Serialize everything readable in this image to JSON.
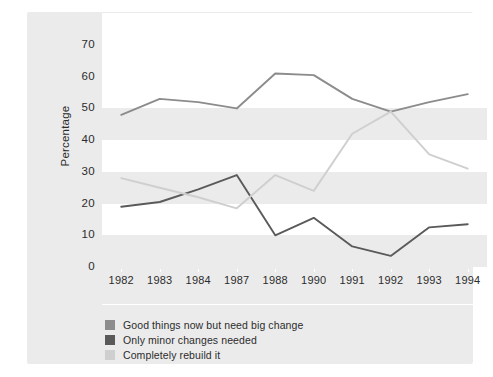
{
  "chart_data": {
    "type": "line",
    "title": "",
    "subtitle": "",
    "xlabel": "",
    "ylabel": "Percentage",
    "categories": [
      "1982",
      "1983",
      "1984",
      "1987",
      "1988",
      "1990",
      "1991",
      "1992",
      "1993",
      "1994"
    ],
    "ylim": [
      0,
      70
    ],
    "ytick_labels": [
      "0",
      "10",
      "20",
      "30",
      "40",
      "50",
      "60",
      "70"
    ],
    "ytick_values": [
      0,
      10,
      20,
      30,
      40,
      50,
      60,
      70
    ],
    "grid": "horizontal-alternating-bands",
    "legend_position": "below-bottom-left",
    "series": [
      {
        "name": "Good things now but need big change",
        "color": "#8c8c8c",
        "values": [
          48,
          53,
          52,
          50,
          61,
          60.5,
          53,
          49,
          52,
          54.5
        ]
      },
      {
        "name": "Only minor changes needed",
        "color": "#5a5a5a",
        "values": [
          19,
          20.5,
          24.5,
          29,
          10,
          15.5,
          6.5,
          3.5,
          12.5,
          13.5
        ]
      },
      {
        "name": "Completely rebuild it",
        "color": "#cfcfcf",
        "values": [
          28,
          25,
          22,
          18.5,
          29,
          24,
          42,
          49,
          35.5,
          31
        ]
      }
    ]
  },
  "legend": {
    "items": [
      {
        "label": "Good things now but need big change",
        "color": "#8c8c8c"
      },
      {
        "label": "Only minor changes needed",
        "color": "#5a5a5a"
      },
      {
        "label": "Completely rebuild it",
        "color": "#cfcfcf"
      }
    ]
  },
  "colors": {
    "panel_background": "#ebebeb",
    "band_background": "#ffffff",
    "page_background": "#ffffff",
    "text": "#2b2b2b"
  }
}
